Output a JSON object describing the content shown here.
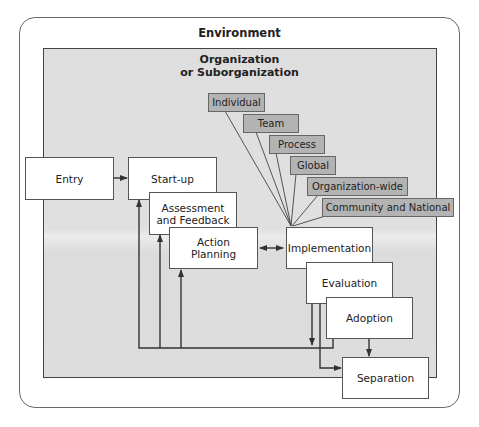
{
  "diagram": {
    "environment": {
      "label": "Environment"
    },
    "organization": {
      "label_line1": "Organization",
      "label_line2": "or Suborganization"
    },
    "stages": {
      "entry": "Entry",
      "startup": "Start-up",
      "assessment_line1": "Assessment",
      "assessment_line2": "and Feedback",
      "action_line1": "Action",
      "action_line2": "Planning",
      "implementation": "Implementation",
      "evaluation": "Evaluation",
      "adoption": "Adoption",
      "separation": "Separation"
    },
    "intervention_levels": [
      {
        "label": "Individual"
      },
      {
        "label": "Team"
      },
      {
        "label": "Process"
      },
      {
        "label": "Global"
      },
      {
        "label": "Organization-wide"
      },
      {
        "label": "Community and National"
      }
    ],
    "colors": {
      "organization_fill": "#dedede",
      "level_tag_fill": "#b3b3b3",
      "stage_fill": "#ffffff",
      "line": "#333333"
    }
  }
}
